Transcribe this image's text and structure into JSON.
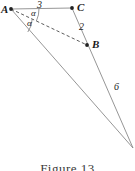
{
  "figure": {
    "caption": "Figure 13",
    "stroke_color": "#8a8a8a",
    "point_color": "#222222",
    "text_color": "#1a1a1a",
    "background_color": "#ffffff",
    "vertices": [
      {
        "id": "A",
        "label": "A",
        "x": 11,
        "y": 9
      },
      {
        "id": "C",
        "label": "C",
        "x": 72,
        "y": 8
      },
      {
        "id": "B",
        "label": "B",
        "x": 87,
        "y": 45
      },
      {
        "id": "D",
        "label": "",
        "x": 133,
        "y": 148
      }
    ],
    "segments": [
      {
        "name": "segment-ac",
        "from": "A",
        "to": "C",
        "style": "solid",
        "length_label": "3"
      },
      {
        "name": "segment-cb",
        "from": "C",
        "to": "B",
        "style": "solid",
        "length_label": "2"
      },
      {
        "name": "segment-ab",
        "from": "A",
        "to": "B",
        "style": "dashed",
        "length_label": ""
      },
      {
        "name": "segment-bd",
        "from": "B",
        "to": "D",
        "style": "solid",
        "length_label": "6"
      },
      {
        "name": "segment-ad",
        "from": "A",
        "to": "D",
        "style": "solid",
        "length_label": ""
      }
    ],
    "lengths": {
      "ac": "3",
      "cb": "2",
      "bd": "6"
    },
    "angles": [
      {
        "name": "angle-upper",
        "label": "α",
        "at": "A",
        "between": "AC and AB"
      },
      {
        "name": "angle-lower",
        "label": "α",
        "at": "A",
        "between": "AB and AD"
      }
    ]
  }
}
